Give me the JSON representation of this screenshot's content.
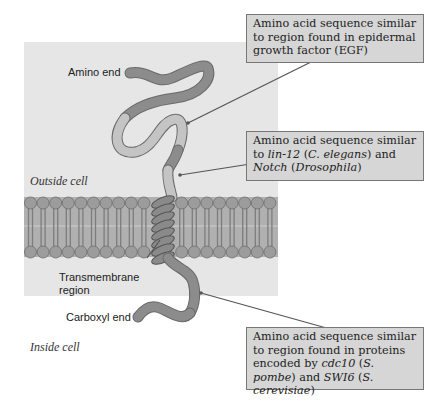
{
  "figure": {
    "regions": {
      "outside": "Outside cell",
      "inside": "Inside cell"
    },
    "labels": {
      "amino_end": "Amino end",
      "transmembrane_1": "Transmembrane",
      "transmembrane_2": "region",
      "carboxyl_end": "Carboxyl end"
    },
    "callouts": [
      {
        "id": "egf",
        "segments": [
          {
            "text": "Amino acid sequence similar to region found in epidermal growth factor (EGF)",
            "italic": false
          }
        ]
      },
      {
        "id": "lin12-notch",
        "segments": [
          {
            "text": "Amino acid sequence similar to ",
            "italic": false
          },
          {
            "text": "lin-12",
            "italic": true
          },
          {
            "text": " (",
            "italic": false
          },
          {
            "text": "C. elegans",
            "italic": true
          },
          {
            "text": ") and ",
            "italic": false
          },
          {
            "text": "Notch",
            "italic": true
          },
          {
            "text": " (",
            "italic": false
          },
          {
            "text": "Drosophila",
            "italic": true
          },
          {
            "text": ")",
            "italic": false
          }
        ]
      },
      {
        "id": "cdc10-swi6",
        "segments": [
          {
            "text": "Amino acid sequence similar to region found in proteins encoded by ",
            "italic": false
          },
          {
            "text": "cdc10",
            "italic": true
          },
          {
            "text": " (",
            "italic": false
          },
          {
            "text": "S. pombe",
            "italic": true
          },
          {
            "text": ") and ",
            "italic": false
          },
          {
            "text": "SWI6",
            "italic": true
          },
          {
            "text": " (",
            "italic": false
          },
          {
            "text": "S. cerevisiae",
            "italic": true
          },
          {
            "text": ")",
            "italic": false
          }
        ]
      }
    ],
    "colors": {
      "panel": "#e6e6e6",
      "protein": "#8a8a8a",
      "protein_light": "#c4c4c4",
      "membrane_head": "#a0a0a0",
      "callout_bg": "#d6d6d6"
    }
  }
}
